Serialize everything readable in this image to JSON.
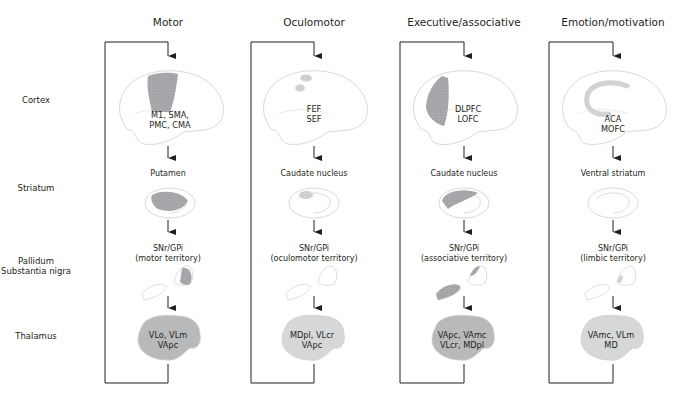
{
  "diagram": {
    "type": "parallel basal ganglia-thalamocortical loops",
    "row_labels": [
      {
        "id": "cortex",
        "lines": [
          "Cortex"
        ]
      },
      {
        "id": "striatum",
        "lines": [
          "Striatum"
        ]
      },
      {
        "id": "pallidum",
        "lines": [
          "Pallidum",
          "Substantia nigra"
        ]
      },
      {
        "id": "thalamus",
        "lines": [
          "Thalamus"
        ]
      }
    ],
    "loops": [
      {
        "title": "Motor",
        "cortex": [
          "M1, SMA,",
          "PMC, CMA"
        ],
        "striatum": "Putamen",
        "pallidum": [
          "SNr/GPi",
          "(motor territory)"
        ],
        "thalamus": [
          "VLo, VLm",
          "VApc"
        ]
      },
      {
        "title": "Oculomotor",
        "cortex": [
          "FEF",
          "SEF"
        ],
        "striatum": "Caudate nucleus",
        "pallidum": [
          "SNr/GPi",
          "(oculomotor territory)"
        ],
        "thalamus": [
          "MDpl, VLcr",
          "VApc"
        ]
      },
      {
        "title": "Executive/associative",
        "cortex": [
          "DLPFC",
          "LOFC"
        ],
        "striatum": "Caudate nucleus",
        "pallidum": [
          "SNr/GPi",
          "(associative territory)"
        ],
        "thalamus": [
          "VApc, VAmc",
          "VLcr, MDpl"
        ]
      },
      {
        "title": "Emotion/motivation",
        "cortex": [
          "ACA",
          "MOFC"
        ],
        "striatum": "Ventral striatum",
        "pallidum": [
          "SNr/GPi",
          "(limbic territory)"
        ],
        "thalamus": [
          "VAmc, VLm",
          "MD"
        ]
      }
    ],
    "colors": {
      "line": "#231f20",
      "outline": "#d9d9d9",
      "highlight": "#a7a9ac",
      "thalamus_dark": "#b3b3b3",
      "thalamus_light": "#d4d4d4"
    }
  }
}
